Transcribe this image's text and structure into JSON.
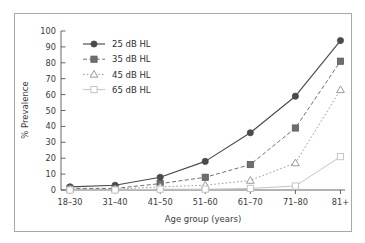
{
  "chart_data": {
    "type": "line",
    "title": "",
    "subtitle": "",
    "xlabel": "Age group (years)",
    "ylabel": "% Prevalence",
    "categories": [
      "18–30",
      "31–40",
      "41–50",
      "51–60",
      "61–70",
      "71–80",
      "81+"
    ],
    "xtick_labels": [
      "18–30",
      "31–40",
      "41–50",
      "51–60",
      "61–70",
      "71–80",
      "81+"
    ],
    "ytick_labels": [
      "0",
      "10",
      "20",
      "30",
      "40",
      "50",
      "60",
      "70",
      "80",
      "90",
      "100"
    ],
    "ytick_values": [
      0,
      10,
      20,
      30,
      40,
      50,
      60,
      70,
      80,
      90,
      100
    ],
    "ylim": [
      0,
      100
    ],
    "grid": false,
    "legend_position": "upper left",
    "series": [
      {
        "name": "25 dB HL",
        "values": [
          2,
          3,
          8,
          18,
          36,
          59,
          94
        ],
        "marker": "filled-circle",
        "linestyle": "solid",
        "color": "#4a4a4a"
      },
      {
        "name": "35 dB HL",
        "values": [
          1,
          1,
          4,
          8,
          16,
          39,
          81
        ],
        "marker": "filled-square",
        "linestyle": "dashed",
        "color": "#6e6e6e"
      },
      {
        "name": "45 dB HL",
        "values": [
          0.5,
          0.5,
          2,
          3,
          6,
          17,
          63
        ],
        "marker": "open-triangle",
        "linestyle": "dotted",
        "color": "#9a9a9a"
      },
      {
        "name": "65 dB HL",
        "values": [
          0,
          0,
          0.5,
          0.5,
          1,
          2.5,
          21
        ],
        "marker": "open-square",
        "linestyle": "solid-light",
        "color": "#c4c4c4"
      }
    ]
  },
  "legend": {
    "entries": [
      {
        "label": "25 dB HL"
      },
      {
        "label": "35 dB HL"
      },
      {
        "label": "45 dB HL"
      },
      {
        "label": "65 dB HL"
      }
    ]
  },
  "axes": {
    "x_title": "Age group (years)",
    "y_title": "% Prevalence"
  },
  "colors": {
    "frame": "#a8a8a8",
    "axis": "#555555",
    "series_1": "#4a4a4a",
    "series_2": "#6e6e6e",
    "series_3": "#9a9a9a",
    "series_4": "#c4c4c4",
    "background": "#ffffff"
  }
}
